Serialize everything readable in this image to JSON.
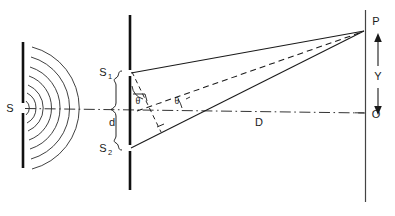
{
  "figure": {
    "background_color": "#ffffff",
    "line_color": "#1a1a1a",
    "width": 395,
    "height": 216
  },
  "labels": {
    "source": "S",
    "slit_top_base": "S",
    "slit_top_sub": "1",
    "slit_bottom_base": "S",
    "slit_bottom_sub": "2",
    "slit_separation": "d",
    "slit_to_screen_distance": "D",
    "point_on_screen": "P",
    "center_of_screen": "O",
    "fringe_distance": "Y",
    "angle_at_slits": "θ",
    "angle_at_axis": "θ"
  },
  "elements": {
    "source_barrier": "source-barrier",
    "wavefronts": "circular-wavefronts",
    "wavefront_count": 7,
    "slit_barrier": "double-slit-barrier",
    "screen": "observation-screen",
    "optic_axis": "dash-dot-optic-axis",
    "ray_s1_to_p": "ray-from-slit1-to-point-p",
    "ray_s2_to_p": "ray-from-slit2-to-point-p",
    "ray_mid_to_p": "dashed-ray-from-midpoint-to-point-p",
    "path_difference": "dashed-perpendicular-path-difference",
    "brace": "slit-separation-brace",
    "y_arrow": "double-headed-arrow-y"
  }
}
